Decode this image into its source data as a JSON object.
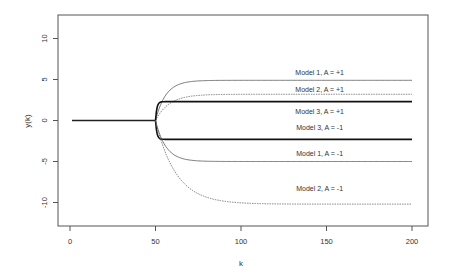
{
  "chart_data": {
    "type": "line",
    "title": "",
    "xlabel": "k",
    "ylabel": "y(k)",
    "xlim": [
      -8,
      208
    ],
    "ylim": [
      -13,
      13
    ],
    "x_ticks": [
      0,
      50,
      100,
      150,
      200
    ],
    "y_ticks": [
      -10,
      -5,
      0,
      5,
      10
    ],
    "grid": false,
    "legend": "none (inline curve labels)",
    "step_at_k": 50,
    "series": [
      {
        "name": "Model 1, A = +1",
        "final": 4.9,
        "style": "solid-thin",
        "tau": 6
      },
      {
        "name": "Model 2, A = +1",
        "final": 3.2,
        "style": "dashed-thin",
        "tau": 8
      },
      {
        "name": "Model 3, A = +1",
        "final": 2.3,
        "style": "solid-thick",
        "tau": 0.8
      },
      {
        "name": "Model 3, A = -1",
        "final": -2.3,
        "style": "solid-thick",
        "tau": 0.8
      },
      {
        "name": "Model 1, A = -1",
        "final": -5.0,
        "style": "solid-thin",
        "tau": 6
      },
      {
        "name": "Model 2, A = -1",
        "final": -10.2,
        "style": "dashed-thin",
        "tau": 12
      }
    ],
    "labels": [
      {
        "text": "Model 1, A = +1",
        "k": 146,
        "y": 5.6
      },
      {
        "text": "Model 2, A = +1",
        "k": 146,
        "y": 3.5
      },
      {
        "text": "Model 3, A = +1",
        "k": 146,
        "y": 0.85
      },
      {
        "text": "Model 3, A = -1",
        "k": 146,
        "y": -1.15
      },
      {
        "text": "Model 1, A = -1",
        "k": 146,
        "y": -4.3
      },
      {
        "text": "Model 2, A = -1",
        "k": 146,
        "y": -8.6
      }
    ]
  }
}
